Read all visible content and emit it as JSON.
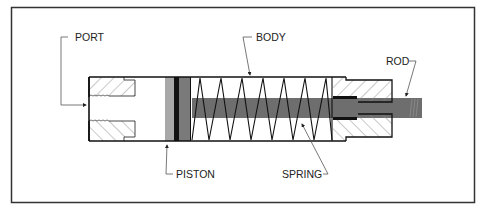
{
  "diagram": {
    "labels": {
      "port": "PORT",
      "body": "BODY",
      "rod": "ROD",
      "piston": "PISTON",
      "spring": "SPRING"
    },
    "colors": {
      "frame": "#333333",
      "outline": "#111111",
      "rod": "#6e6e6e",
      "piston_light": "#a8a8a8",
      "piston_dark": "#7a7a7a",
      "seal": "#111111",
      "hatch": "#888888"
    }
  }
}
